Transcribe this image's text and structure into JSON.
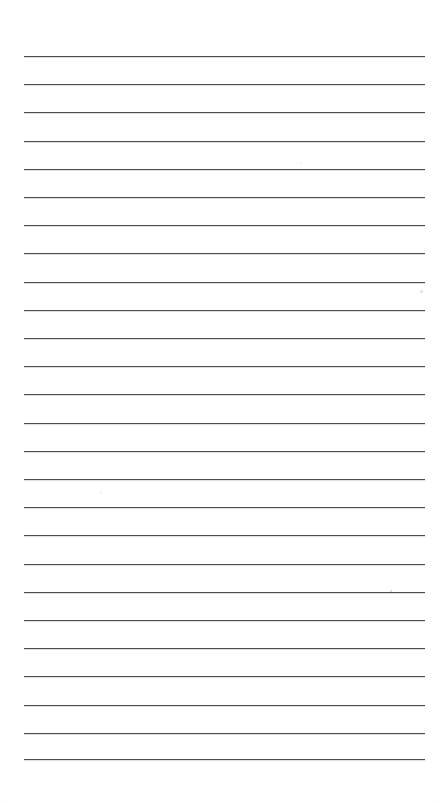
{
  "document": {
    "kind": "lined-paper",
    "title": "",
    "body_text": "",
    "is_blank": true,
    "background_color": "#ffffff",
    "page_width": 442,
    "page_height": 803
  },
  "ruling": {
    "line_color": "#4d4d4d",
    "line_thickness_px": 1,
    "line_count": 25,
    "first_line_y": 56,
    "line_spacing_px": 28.2,
    "line_left_x": 24,
    "line_right_x": 425,
    "lines_y": [
      56,
      84.2,
      112.4,
      140.6,
      168.8,
      197,
      225.2,
      253.4,
      281.6,
      309.8,
      338,
      366.2,
      394.4,
      422.6,
      450.8,
      479,
      507.2,
      535.4,
      563.6,
      591.8,
      620,
      648.2,
      676.4,
      704.6,
      732.8,
      759
    ]
  },
  "margins": {
    "top_margin_px": 56,
    "bottom_margin_px": 44,
    "left_margin_px": 24,
    "right_margin_px": 17
  },
  "artifacts": {
    "specks": [
      {
        "x": 420,
        "y": 290,
        "size": 3,
        "color": "rgba(170,170,170,0.35)"
      },
      {
        "x": 390,
        "y": 590,
        "size": 2,
        "color": "rgba(160,160,160,0.45)"
      },
      {
        "x": 100,
        "y": 492,
        "size": 2,
        "color": "rgba(185,185,185,0.30)"
      },
      {
        "x": 300,
        "y": 162,
        "size": 2,
        "color": "rgba(190,190,190,0.25)"
      }
    ]
  }
}
